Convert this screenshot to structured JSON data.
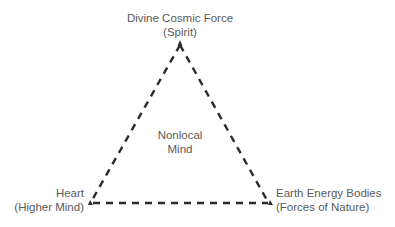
{
  "diagram": {
    "type": "triangle",
    "line_style": "dashed",
    "line_color": "#2b2b2b",
    "vertices": {
      "top": {
        "line1": "Divine Cosmic Force",
        "line2": "(Spirit)"
      },
      "bottom_left": {
        "line1": "Heart",
        "line2": "(Higher Mind)"
      },
      "bottom_right": {
        "line1": "Earth Energy Bodies",
        "line2": "(Forces of Nature)"
      }
    },
    "center": {
      "line1": "Nonlocal",
      "line2": "Mind"
    }
  }
}
